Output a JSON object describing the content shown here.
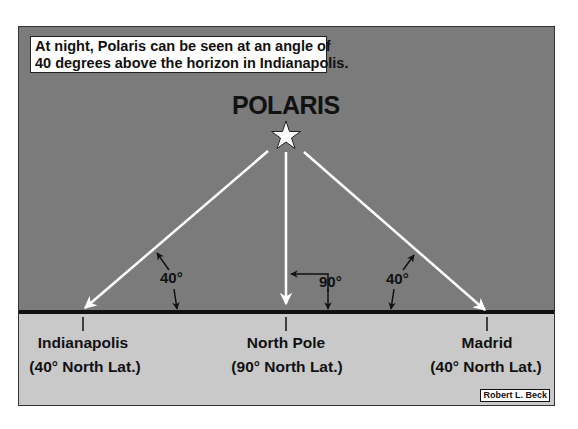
{
  "caption": {
    "line1": "At night, Polaris can be seen at an angle of",
    "line2": "40 degrees above the horizon in Indianapolis."
  },
  "star": {
    "name": "POLARIS",
    "icon": "star-icon"
  },
  "angles": {
    "left": "40°",
    "center": "90°",
    "right": "40°"
  },
  "locations": [
    {
      "name": "Indianapolis",
      "lat": "(40° North Lat.)"
    },
    {
      "name": "North Pole",
      "lat": "(90° North Lat.)"
    },
    {
      "name": "Madrid",
      "lat": "(40° North Lat.)"
    }
  ],
  "credit": "Robert L. Beck",
  "colors": {
    "sky": "#7b7b7b",
    "ground": "#c9c9c9",
    "horizon": "#111111",
    "arrow": "#ffffff"
  }
}
